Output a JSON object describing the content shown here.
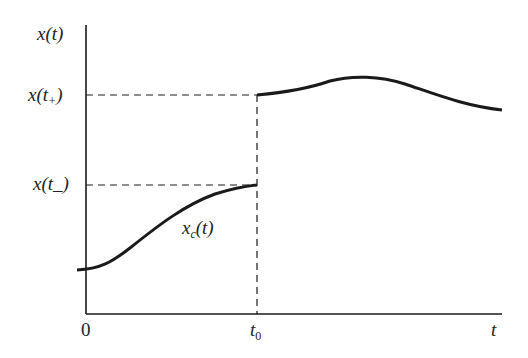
{
  "diagram": {
    "y_axis_label": "x(t)",
    "x_axis_label": "t",
    "origin_label": "0",
    "t0_label": "t",
    "t0_sub": "0",
    "x_plus_label_pre": "x(t",
    "x_plus_sub": "+",
    "x_plus_label_post": ")",
    "x_minus_label": "x(t_)",
    "curve_label_pre": "x",
    "curve_label_sub": "c",
    "curve_label_post": "(t)",
    "colors": {
      "line": "#1a1a1a",
      "background": "#ffffff"
    }
  }
}
